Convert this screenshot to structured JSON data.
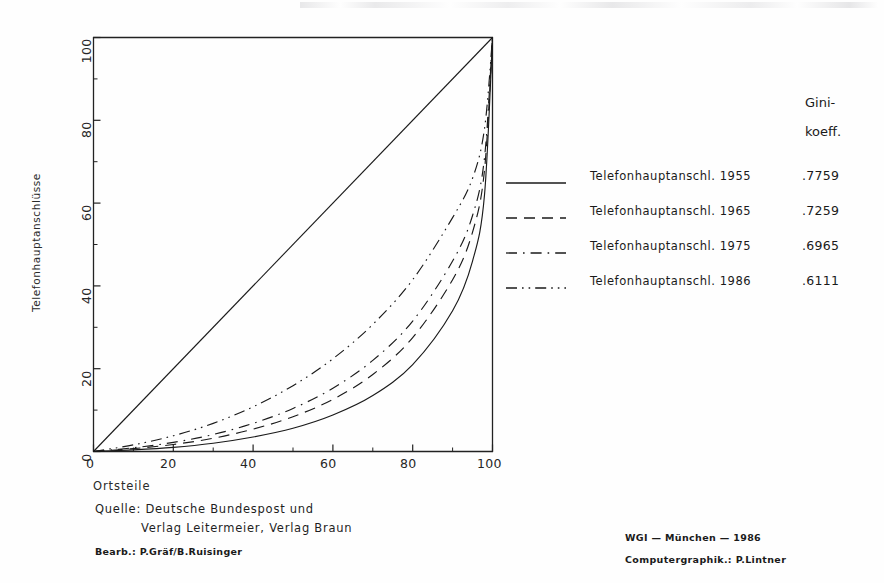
{
  "chart_data": {
    "type": "line",
    "title": "",
    "xlabel": "Ortsteile",
    "ylabel": "Telefonhauptanschlüsse",
    "xlim": [
      0,
      100
    ],
    "ylim": [
      0,
      100
    ],
    "xticks": [
      "0",
      "20",
      "40",
      "60",
      "80",
      "100"
    ],
    "xtick_values": [
      0,
      20,
      40,
      60,
      80,
      100
    ],
    "yticks": [
      "0",
      "20",
      "40",
      "60",
      "80",
      "100"
    ],
    "ytick_values": [
      0,
      20,
      40,
      60,
      80,
      100
    ],
    "minor_tick_step": 10,
    "grid": false,
    "legend_position": "right",
    "x": [
      0,
      10,
      20,
      30,
      40,
      50,
      60,
      70,
      80,
      90,
      95,
      98,
      100
    ],
    "series": [
      {
        "name": "Telefonhauptanschl. 1955",
        "gini": ".7759",
        "linestyle": "solid",
        "values": [
          0,
          0.4,
          1.0,
          2.0,
          3.5,
          5.6,
          8.8,
          13.5,
          21.0,
          34.0,
          46.0,
          62.0,
          100
        ]
      },
      {
        "name": "Telefonhauptanschl. 1965",
        "gini": ".7259",
        "linestyle": "dashed",
        "values": [
          0,
          0.7,
          1.7,
          3.2,
          5.4,
          8.4,
          12.6,
          18.6,
          27.5,
          41.5,
          53.0,
          68.0,
          100
        ]
      },
      {
        "name": "Telefonhauptanschl. 1975",
        "gini": ".6965",
        "linestyle": "dashdot",
        "values": [
          0,
          0.9,
          2.2,
          4.1,
          6.8,
          10.4,
          15.3,
          22.0,
          31.5,
          46.0,
          57.0,
          71.0,
          100
        ]
      },
      {
        "name": "Telefonhauptanschl. 1986",
        "gini": ".6111",
        "linestyle": "dashdotdot",
        "values": [
          0,
          1.6,
          3.8,
          6.8,
          10.8,
          15.9,
          22.4,
          30.7,
          41.5,
          56.5,
          66.0,
          78.0,
          100
        ]
      }
    ],
    "reference_line": {
      "name": "equal-distribution-diagonal",
      "from": [
        0,
        0
      ],
      "to": [
        100,
        100
      ],
      "linestyle": "solid"
    },
    "line_color": "#1a1a1a"
  },
  "legend": {
    "header_line1": "Gini-",
    "header_line2": "koeff.",
    "rows": [
      {
        "label": "Telefonhauptanschl. 1955",
        "value": ".7759",
        "style": "solid"
      },
      {
        "label": "Telefonhauptanschl. 1965",
        "value": ".7259",
        "style": "dashed"
      },
      {
        "label": "Telefonhauptanschl. 1975",
        "value": ".6965",
        "style": "dashdot"
      },
      {
        "label": "Telefonhauptanschl. 1986",
        "value": ".6111",
        "style": "dashdotdot"
      }
    ]
  },
  "axes": {
    "x_title": "Ortsteile",
    "y_title": "Telefonhauptanschlüsse",
    "x_tick_0": "0",
    "x_tick_1": "20",
    "x_tick_2": "40",
    "x_tick_3": "60",
    "x_tick_4": "80",
    "x_tick_5": "100",
    "y_tick_0": "0",
    "y_tick_1": "20",
    "y_tick_2": "40",
    "y_tick_3": "60",
    "y_tick_4": "80",
    "y_tick_5": "100"
  },
  "footer": {
    "source_line1": "Quelle: Deutsche Bundespost und",
    "source_line2": "Verlag Leitermeier, Verlag Braun",
    "bearb": "Bearb.: P.Gräf/B.Ruisinger",
    "institute": "WGI — München — 1986",
    "graphics": "Computergraphik.: P.Lintner"
  }
}
